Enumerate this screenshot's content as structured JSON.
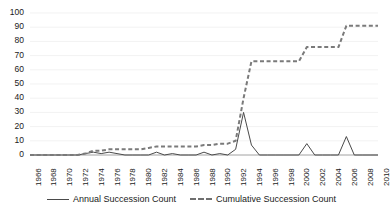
{
  "chart_data": {
    "type": "line",
    "title": "",
    "xlabel": "",
    "ylabel": "",
    "xlim": [
      1966,
      2010
    ],
    "ylim": [
      0,
      100
    ],
    "grid": true,
    "legend_position": "bottom",
    "y_ticks": [
      0,
      10,
      20,
      30,
      40,
      50,
      60,
      70,
      80,
      90,
      100
    ],
    "x_ticks": [
      1966,
      1968,
      1970,
      1972,
      1974,
      1976,
      1978,
      1980,
      1982,
      1984,
      1986,
      1988,
      1990,
      1992,
      1994,
      1996,
      1998,
      2000,
      2002,
      2004,
      2006,
      2008,
      2010
    ],
    "x": [
      1966,
      1967,
      1968,
      1969,
      1970,
      1971,
      1972,
      1973,
      1974,
      1975,
      1976,
      1977,
      1978,
      1979,
      1980,
      1981,
      1982,
      1983,
      1984,
      1985,
      1986,
      1987,
      1988,
      1989,
      1990,
      1991,
      1992,
      1993,
      1994,
      1995,
      1996,
      1997,
      1998,
      1999,
      2000,
      2001,
      2002,
      2003,
      2004,
      2005,
      2006,
      2007,
      2008,
      2009,
      2010
    ],
    "series": [
      {
        "name": "Annual Succession Count",
        "style": "solid",
        "color": "#4a4a4a",
        "values": [
          0,
          0,
          0,
          0,
          0,
          0,
          0,
          1,
          2,
          1,
          2,
          1,
          0,
          0,
          0,
          0,
          2,
          0,
          1,
          0,
          0,
          0,
          2,
          0,
          1,
          0,
          4,
          30,
          7,
          0,
          0,
          0,
          0,
          0,
          0,
          8,
          0,
          0,
          0,
          0,
          13,
          0,
          0,
          0,
          0
        ]
      },
      {
        "name": "Cumulative Succession Count",
        "style": "dashed",
        "color": "#7a7a7a",
        "values": [
          0,
          0,
          0,
          0,
          0,
          0,
          0,
          1,
          3,
          3,
          4,
          4,
          4,
          4,
          4,
          5,
          6,
          6,
          6,
          6,
          6,
          6,
          7,
          7,
          8,
          8,
          10,
          40,
          66,
          66,
          66,
          66,
          66,
          66,
          66,
          76,
          76,
          76,
          76,
          76,
          91,
          91,
          91,
          91,
          91
        ]
      }
    ]
  },
  "legend": {
    "entries": [
      {
        "label": "Annual Succession Count"
      },
      {
        "label": "Cumulative Succession Count"
      }
    ]
  },
  "axis": {
    "y_labels": [
      "100",
      "90",
      "80",
      "70",
      "60",
      "50",
      "40",
      "30",
      "20",
      "10",
      "0"
    ],
    "x_labels": [
      "1966",
      "1968",
      "1970",
      "1972",
      "1974",
      "1976",
      "1978",
      "1980",
      "1982",
      "1984",
      "1986",
      "1988",
      "1990",
      "1992",
      "1994",
      "1996",
      "1998",
      "2000",
      "2002",
      "2004",
      "2006",
      "2008",
      "2010"
    ]
  },
  "colors": {
    "annual_line": "#4a4a4a",
    "cumulative_line": "#7a7a7a",
    "gridline": "#ededed",
    "axis_text": "#1a1a1a",
    "background": "#ffffff"
  }
}
